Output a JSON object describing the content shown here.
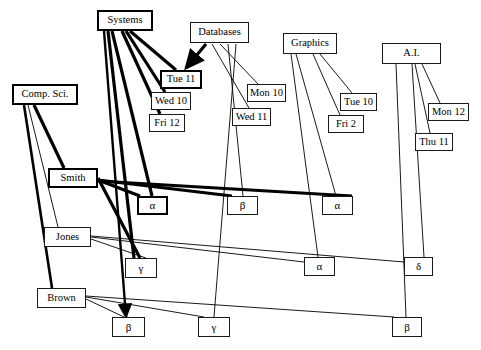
{
  "diagram": {
    "type": "bipartite-matching-diagram",
    "background": "#ffffff",
    "ink": "#000000",
    "highlight_color": "#000000",
    "nodes": [
      {
        "id": "systems",
        "label": "Systems",
        "x": 97,
        "y": 10,
        "w": 56,
        "h": 21,
        "bold": true,
        "role": "course"
      },
      {
        "id": "databases",
        "label": "Databases",
        "x": 190,
        "y": 22,
        "w": 59,
        "h": 21,
        "bold": false,
        "role": "course"
      },
      {
        "id": "graphics",
        "label": "Graphics",
        "x": 283,
        "y": 33,
        "w": 54,
        "h": 21,
        "bold": false,
        "role": "course"
      },
      {
        "id": "ai",
        "label": "A.I.",
        "x": 382,
        "y": 43,
        "w": 59,
        "h": 21,
        "bold": false,
        "role": "course"
      },
      {
        "id": "tue11",
        "label": "Tue  11",
        "x": 160,
        "y": 70,
        "w": 42,
        "h": 19,
        "bold": true,
        "role": "slot"
      },
      {
        "id": "wed10",
        "label": "Wed 10",
        "x": 151,
        "y": 92,
        "w": 40,
        "h": 18,
        "bold": false,
        "role": "slot"
      },
      {
        "id": "fri12",
        "label": "Fri 12",
        "x": 149,
        "y": 114,
        "w": 36,
        "h": 18,
        "bold": false,
        "role": "slot"
      },
      {
        "id": "mon10",
        "label": "Mon 10",
        "x": 247,
        "y": 84,
        "w": 39,
        "h": 18,
        "bold": false,
        "role": "slot"
      },
      {
        "id": "wed11",
        "label": "Wed 11",
        "x": 232,
        "y": 108,
        "w": 39,
        "h": 18,
        "bold": false,
        "role": "slot"
      },
      {
        "id": "tue10",
        "label": "Tue 10",
        "x": 340,
        "y": 93,
        "w": 37,
        "h": 18,
        "bold": false,
        "role": "slot"
      },
      {
        "id": "fri2",
        "label": "Fri  2",
        "x": 328,
        "y": 115,
        "w": 36,
        "h": 18,
        "bold": false,
        "role": "slot"
      },
      {
        "id": "mon12",
        "label": "Mon 12",
        "x": 428,
        "y": 103,
        "w": 41,
        "h": 18,
        "bold": false,
        "role": "slot"
      },
      {
        "id": "thu11",
        "label": "Thu 11",
        "x": 415,
        "y": 133,
        "w": 38,
        "h": 18,
        "bold": false,
        "role": "slot"
      },
      {
        "id": "compsci",
        "label": "Comp. Sci.",
        "x": 12,
        "y": 84,
        "w": 66,
        "h": 21,
        "bold": true,
        "role": "person"
      },
      {
        "id": "smith",
        "label": "Smith",
        "x": 48,
        "y": 168,
        "w": 50,
        "h": 20,
        "bold": true,
        "role": "person"
      },
      {
        "id": "jones",
        "label": "Jones",
        "x": 44,
        "y": 227,
        "w": 47,
        "h": 20,
        "bold": false,
        "role": "person"
      },
      {
        "id": "brown",
        "label": "Brown",
        "x": 37,
        "y": 288,
        "w": 49,
        "h": 20,
        "bold": false,
        "role": "person"
      },
      {
        "id": "alpha1",
        "label": "α",
        "x": 137,
        "y": 196,
        "w": 31,
        "h": 19,
        "bold": true,
        "role": "room"
      },
      {
        "id": "beta1",
        "label": "β",
        "x": 227,
        "y": 196,
        "w": 31,
        "h": 19,
        "bold": false,
        "role": "room"
      },
      {
        "id": "alpha2",
        "label": "α",
        "x": 322,
        "y": 196,
        "w": 31,
        "h": 19,
        "bold": false,
        "role": "room"
      },
      {
        "id": "gamma1",
        "label": "γ",
        "x": 125,
        "y": 258,
        "w": 32,
        "h": 20,
        "bold": false,
        "role": "room"
      },
      {
        "id": "alpha3",
        "label": "α",
        "x": 304,
        "y": 257,
        "w": 31,
        "h": 19,
        "bold": false,
        "role": "room"
      },
      {
        "id": "delta1",
        "label": "δ",
        "x": 404,
        "y": 257,
        "w": 29,
        "h": 19,
        "bold": false,
        "role": "room"
      },
      {
        "id": "beta2",
        "label": "β",
        "x": 112,
        "y": 317,
        "w": 33,
        "h": 20,
        "bold": false,
        "role": "room"
      },
      {
        "id": "gamma2",
        "label": "γ",
        "x": 198,
        "y": 317,
        "w": 32,
        "h": 20,
        "bold": false,
        "role": "room"
      },
      {
        "id": "beta3",
        "label": "β",
        "x": 392,
        "y": 317,
        "w": 30,
        "h": 20,
        "bold": false,
        "role": "room"
      }
    ],
    "edges": [
      {
        "from": "systems",
        "to": "tue11",
        "x1": 130,
        "y1": 31,
        "x2": 176,
        "y2": 70,
        "w": 3.2
      },
      {
        "from": "systems",
        "to": "wed10",
        "x1": 126,
        "y1": 31,
        "x2": 165,
        "y2": 92,
        "w": 3.2
      },
      {
        "from": "systems",
        "to": "fri12",
        "x1": 122,
        "y1": 31,
        "x2": 160,
        "y2": 114,
        "w": 3.2
      },
      {
        "from": "databases",
        "to": "tue11",
        "x1": 206,
        "y1": 44,
        "x2": 186,
        "y2": 68,
        "w": 3.2,
        "arrow": true
      },
      {
        "from": "databases",
        "to": "mon10",
        "x1": 220,
        "y1": 44,
        "x2": 258,
        "y2": 84,
        "w": 0.9
      },
      {
        "from": "databases",
        "to": "wed11",
        "x1": 212,
        "y1": 44,
        "x2": 249,
        "y2": 108,
        "w": 0.9
      },
      {
        "from": "databases",
        "to": "beta1",
        "x1": 228,
        "y1": 44,
        "x2": 243,
        "y2": 196,
        "w": 0.9
      },
      {
        "from": "databases",
        "to": "gamma2",
        "x1": 236,
        "y1": 44,
        "x2": 214,
        "y2": 317,
        "w": 0.9
      },
      {
        "from": "graphics",
        "to": "tue10",
        "x1": 320,
        "y1": 54,
        "x2": 352,
        "y2": 93,
        "w": 0.9
      },
      {
        "from": "graphics",
        "to": "fri2",
        "x1": 313,
        "y1": 54,
        "x2": 340,
        "y2": 115,
        "w": 0.9
      },
      {
        "from": "graphics",
        "to": "alpha2",
        "x1": 296,
        "y1": 54,
        "x2": 336,
        "y2": 196,
        "w": 0.9
      },
      {
        "from": "graphics",
        "to": "alpha3",
        "x1": 291,
        "y1": 54,
        "x2": 318,
        "y2": 257,
        "w": 0.9
      },
      {
        "from": "ai",
        "to": "mon12",
        "x1": 422,
        "y1": 64,
        "x2": 440,
        "y2": 103,
        "w": 0.9
      },
      {
        "from": "ai",
        "to": "thu11",
        "x1": 415,
        "y1": 64,
        "x2": 430,
        "y2": 133,
        "w": 0.9
      },
      {
        "from": "ai",
        "to": "delta1",
        "x1": 412,
        "y1": 64,
        "x2": 424,
        "y2": 257,
        "w": 0.9
      },
      {
        "from": "ai",
        "to": "beta3",
        "x1": 396,
        "y1": 64,
        "x2": 406,
        "y2": 317,
        "w": 0.9
      },
      {
        "from": "compsci",
        "to": "smith",
        "x1": 34,
        "y1": 105,
        "x2": 64,
        "y2": 168,
        "w": 3.2
      },
      {
        "from": "compsci",
        "to": "jones",
        "x1": 28,
        "y1": 105,
        "x2": 58,
        "y2": 227,
        "w": 0.9
      },
      {
        "from": "compsci",
        "to": "brown",
        "x1": 24,
        "y1": 105,
        "x2": 52,
        "y2": 288,
        "w": 2.6
      },
      {
        "from": "smith",
        "to": "alpha1",
        "x1": 98,
        "y1": 180,
        "x2": 140,
        "y2": 196,
        "w": 3.2
      },
      {
        "from": "smith",
        "to": "beta1",
        "x1": 98,
        "y1": 180,
        "x2": 232,
        "y2": 196,
        "w": 3.2
      },
      {
        "from": "smith",
        "to": "alpha2",
        "x1": 98,
        "y1": 181,
        "x2": 352,
        "y2": 196,
        "w": 3.2
      },
      {
        "from": "smith",
        "to": "gamma1",
        "x1": 98,
        "y1": 178,
        "x2": 140,
        "y2": 258,
        "w": 3.2
      },
      {
        "from": "jones",
        "to": "gamma1",
        "x1": 91,
        "y1": 239,
        "x2": 146,
        "y2": 258,
        "w": 0.9
      },
      {
        "from": "jones",
        "to": "alpha3",
        "x1": 91,
        "y1": 237,
        "x2": 304,
        "y2": 262,
        "w": 0.9
      },
      {
        "from": "jones",
        "to": "delta1",
        "x1": 91,
        "y1": 236,
        "x2": 404,
        "y2": 262,
        "w": 0.9
      },
      {
        "from": "brown",
        "to": "beta2",
        "x1": 86,
        "y1": 299,
        "x2": 124,
        "y2": 317,
        "w": 0.9
      },
      {
        "from": "brown",
        "to": "gamma2",
        "x1": 86,
        "y1": 297,
        "x2": 204,
        "y2": 317,
        "w": 0.9
      },
      {
        "from": "brown",
        "to": "beta3",
        "x1": 86,
        "y1": 296,
        "x2": 394,
        "y2": 317,
        "w": 0.9
      },
      {
        "from": "systems",
        "to": "gamma1",
        "x1": 108,
        "y1": 31,
        "x2": 134,
        "y2": 258,
        "w": 3.2
      },
      {
        "from": "systems",
        "to": "alpha1",
        "x1": 112,
        "y1": 31,
        "x2": 152,
        "y2": 196,
        "w": 3.2
      },
      {
        "from": "systems",
        "to": "beta2",
        "x1": 104,
        "y1": 31,
        "x2": 126,
        "y2": 317,
        "w": 2.4,
        "arrow": true
      }
    ]
  }
}
